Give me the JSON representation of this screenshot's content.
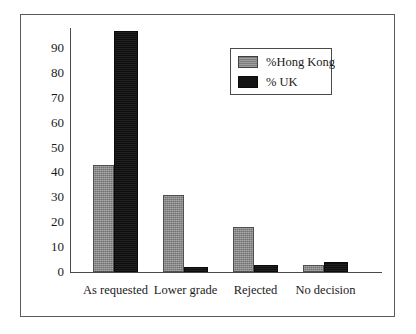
{
  "chart_data": {
    "type": "bar",
    "title": "",
    "subtitle": "",
    "xlabel": "",
    "ylabel": "",
    "categories": [
      "As requested",
      "Lower grade",
      "Rejected",
      "No decision"
    ],
    "series": [
      {
        "name": "%Hong Kong",
        "color": "#8a8a8a",
        "values": [
          43,
          31,
          18,
          3
        ]
      },
      {
        "name": "% UK",
        "color": "#141414",
        "values": [
          97,
          2,
          3,
          4
        ]
      }
    ],
    "ylim": [
      0,
      100
    ],
    "y_ticks": [
      0,
      10,
      20,
      30,
      40,
      50,
      60,
      70,
      80,
      90
    ],
    "y_tick_labels": [
      "0",
      "10",
      "20",
      "30",
      "40",
      "50",
      "60",
      "70",
      "80",
      "90"
    ],
    "grid": false,
    "legend_position": "upper-right",
    "legend_entries": [
      "%Hong Kong",
      "% UK"
    ],
    "annotations": []
  },
  "figure": {
    "border_color": "#5a5a5a",
    "background": "#ffffff",
    "axis_color": "#4a4a4a"
  }
}
